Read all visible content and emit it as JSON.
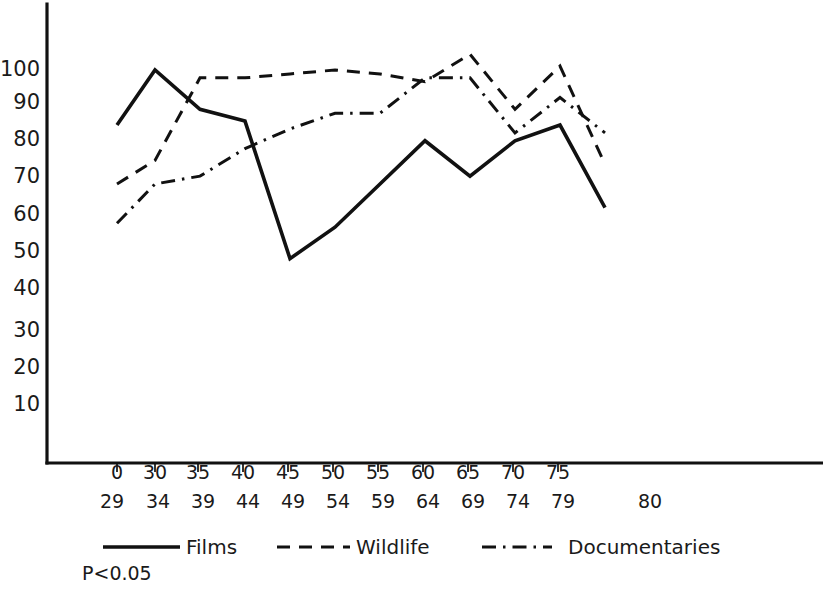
{
  "chart_data": {
    "type": "line",
    "title": "",
    "xlabel": "",
    "ylabel": "",
    "ylim": [
      0,
      110
    ],
    "yticks": [
      10,
      20,
      30,
      40,
      50,
      60,
      70,
      80,
      90,
      100
    ],
    "grid": false,
    "legend_position": "bottom",
    "annotations": [
      "P<0.05"
    ],
    "significance_note": "P<0.05",
    "categories": [
      "25-29",
      "30-34",
      "35-39",
      "40-44",
      "45-49",
      "50-54",
      "55-59",
      "60-64",
      "65-69",
      "70-74",
      "75-79",
      "80"
    ],
    "xtick_top_labels": [
      "0",
      "30",
      "35",
      "40",
      "45",
      "50",
      "55",
      "60",
      "65",
      "70",
      "75",
      ""
    ],
    "xtick_bottom_labels": [
      "29",
      "34",
      "39",
      "44",
      "49",
      "54",
      "59",
      "64",
      "69",
      "74",
      "79",
      "80"
    ],
    "series": [
      {
        "name": "Films",
        "style": "solid",
        "values": [
          86,
          100,
          90,
          87,
          52,
          60,
          71,
          82,
          73,
          82,
          86,
          65
        ]
      },
      {
        "name": "Wildlife",
        "style": "dashed",
        "values": [
          71,
          77,
          98,
          98,
          99,
          100,
          99,
          97,
          104,
          90,
          101,
          76
        ]
      },
      {
        "name": "Documentaries",
        "style": "dash-dot",
        "values": [
          61,
          71,
          73,
          80,
          85,
          89,
          89,
          98,
          98,
          84,
          93,
          84
        ]
      }
    ],
    "colors": {
      "ink": "#111111",
      "background": "#ffffff"
    }
  },
  "legend": {
    "items": [
      {
        "label": "Films",
        "style": "solid"
      },
      {
        "label": "Wildlife",
        "style": "dashed"
      },
      {
        "label": "Documentaries",
        "style": "dash-dot"
      }
    ]
  },
  "footnote": {
    "text": "P<0.05"
  }
}
